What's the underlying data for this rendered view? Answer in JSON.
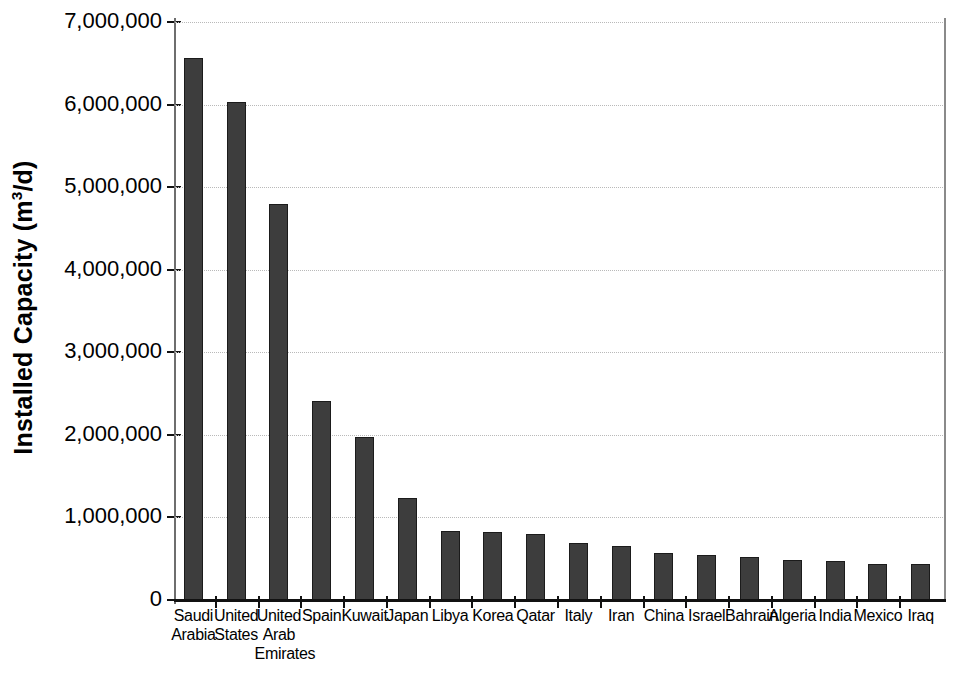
{
  "chart_data": {
    "type": "bar",
    "title": "",
    "xlabel": "",
    "ylabel": "Installed Capacity (m³/d)",
    "ylabel_parts": {
      "main": "Installed Capacity (m",
      "sup": "3",
      "tail": "/d)"
    },
    "categories": [
      "Saudi Arabia",
      "United States",
      "United Arab Emirates",
      "Spain",
      "Kuwait",
      "Japan",
      "Libya",
      "Korea",
      "Qatar",
      "Italy",
      "Iran",
      "China",
      "Israel",
      "Bahrain",
      "Algeria",
      "India",
      "Mexico",
      "Iraq"
    ],
    "category_lines": [
      [
        "Saudi",
        "Arabia"
      ],
      [
        "United",
        "States"
      ],
      [
        "United",
        "Arab",
        "Emirates"
      ],
      [
        "Spain"
      ],
      [
        "Kuwait"
      ],
      [
        "Japan"
      ],
      [
        "Libya"
      ],
      [
        "Korea"
      ],
      [
        "Qatar"
      ],
      [
        "Italy"
      ],
      [
        "Iran"
      ],
      [
        "China"
      ],
      [
        "Israel"
      ],
      [
        "Bahrain"
      ],
      [
        "Algeria"
      ],
      [
        "India"
      ],
      [
        "Mexico"
      ],
      [
        "Iraq"
      ]
    ],
    "values": [
      6570000,
      6030000,
      4800000,
      2410000,
      1970000,
      1230000,
      840000,
      820000,
      800000,
      690000,
      660000,
      570000,
      550000,
      520000,
      480000,
      470000,
      440000,
      430000
    ],
    "ylim": [
      0,
      7000000
    ],
    "ytick_values": [
      0,
      1000000,
      2000000,
      3000000,
      4000000,
      5000000,
      6000000,
      7000000
    ],
    "ytick_labels": [
      "0",
      "1,000,000",
      "2,000,000",
      "3,000,000",
      "4,000,000",
      "5,000,000",
      "6,000,000",
      "7,000,000"
    ],
    "grid": true,
    "grid_style": "dotted",
    "legend": null,
    "bar_color": "#3d3d3d",
    "bar_edge_color": "#1b1b1b",
    "grid_color": "#b9b9b9",
    "axis_color": "#111111",
    "background_color": "#ffffff"
  }
}
